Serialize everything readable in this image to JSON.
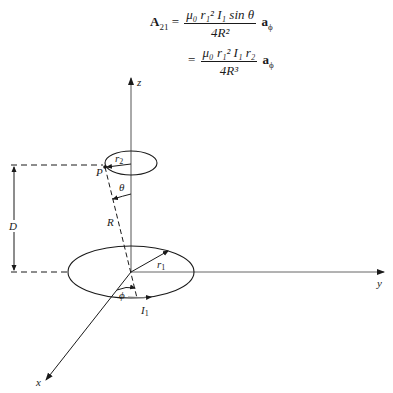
{
  "equations": [
    {
      "lhs": "A",
      "lhs_sub": "21",
      "equals": "=",
      "numerator": "μ₀ r₁² I₁ sin θ",
      "denominator": "4R²",
      "vector": "a",
      "vector_sub": "ϕ"
    },
    {
      "equals": "=",
      "numerator": "μ₀ r₁² I₁ r₂",
      "denominator": "4R³",
      "vector": "a",
      "vector_sub": "ϕ"
    }
  ],
  "diagram": {
    "axes": {
      "z": "z",
      "y": "y",
      "x": "x"
    },
    "labels": {
      "r2": "r",
      "r2_sub": "2",
      "r1": "r",
      "r1_sub": "1",
      "point": "P",
      "theta": "θ",
      "R": "R",
      "D": "D",
      "phi": "ϕ",
      "current": "I",
      "current_sub": "1"
    },
    "colors": {
      "line": "#1a1a1a",
      "axis": "#555555"
    }
  }
}
